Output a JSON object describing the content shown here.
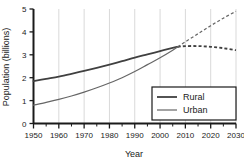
{
  "chart_data": {
    "type": "line",
    "title": "",
    "xlabel": "Year",
    "ylabel": "Population (billions)",
    "xlim": [
      1950,
      2030
    ],
    "ylim": [
      0,
      5
    ],
    "xticks": [
      1950,
      1960,
      1970,
      1980,
      1990,
      2000,
      2010,
      2020,
      2030
    ],
    "xtick_labels": [
      "1950",
      "1960",
      "1970",
      "1980",
      "1990",
      "2000",
      "2010",
      "2020",
      "2030"
    ],
    "yticks": [
      0,
      1,
      2,
      3,
      4,
      5
    ],
    "ytick_labels": [
      "0",
      "1",
      "2",
      "3",
      "4",
      "5"
    ],
    "x_minor_tick_interval": 5,
    "grid": "vertical-only",
    "grid_color": "#d9d9d9",
    "axis_color": "#1a1a1a",
    "background": "#ffffff",
    "projection_starts_at": 2007,
    "crossover": {
      "year": 2007,
      "value": 3.35
    },
    "legend_position": "lower-right",
    "x": [
      1950,
      1955,
      1960,
      1965,
      1970,
      1975,
      1980,
      1985,
      1990,
      1995,
      2000,
      2005,
      2007,
      2010,
      2015,
      2020,
      2025,
      2030
    ],
    "series": [
      {
        "name": "Rural",
        "color": "#404040",
        "line_width": 1.8,
        "values": [
          1.85,
          1.95,
          2.05,
          2.17,
          2.3,
          2.43,
          2.57,
          2.72,
          2.88,
          3.02,
          3.16,
          3.3,
          3.35,
          3.38,
          3.38,
          3.35,
          3.29,
          3.2
        ],
        "solid_until": 2007,
        "dashed_after": 2007
      },
      {
        "name": "Urban",
        "color": "#666666",
        "line_width": 1.2,
        "values": [
          0.8,
          0.92,
          1.05,
          1.2,
          1.37,
          1.56,
          1.77,
          2.0,
          2.27,
          2.57,
          2.87,
          3.2,
          3.35,
          3.57,
          3.92,
          4.27,
          4.6,
          4.9
        ],
        "solid_until": 2007,
        "dashed_after": 2007
      }
    ]
  },
  "legend": {
    "items": [
      {
        "label": "Rural"
      },
      {
        "label": "Urban"
      }
    ]
  }
}
